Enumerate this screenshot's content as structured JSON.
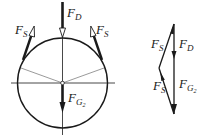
{
  "diagram": {
    "colors": {
      "ink": "#1a1a1a",
      "thin": "#555555",
      "background": "#ffffff"
    },
    "free_body": {
      "circle": {
        "cx": 62.5,
        "cy": 83,
        "r": 45
      },
      "forces": [
        {
          "id": "F_D",
          "label_main": "F",
          "label_sub": "D",
          "direction": "down",
          "arrowhead": "hollow"
        },
        {
          "id": "F_S_left",
          "label_main": "F",
          "label_sub": "S",
          "direction": "up-right tangent",
          "arrowhead": "hollow"
        },
        {
          "id": "F_S_right",
          "label_main": "F",
          "label_sub": "S",
          "direction": "up-left tangent",
          "arrowhead": "hollow"
        },
        {
          "id": "F_G2",
          "label_main": "F",
          "label_sub": "G",
          "label_subsub": "2",
          "direction": "down",
          "arrowhead": "filled"
        }
      ]
    },
    "force_polygon": {
      "vertices": {
        "top": [
          174,
          24
        ],
        "left": [
          159,
          68
        ],
        "bottom": [
          174,
          114
        ]
      },
      "labels": [
        {
          "id": "F_S_upper",
          "label_main": "F",
          "label_sub": "S"
        },
        {
          "id": "F_D",
          "label_main": "F",
          "label_sub": "D"
        },
        {
          "id": "F_S_lower",
          "label_main": "F",
          "label_sub": "S"
        },
        {
          "id": "F_G2",
          "label_main": "F",
          "label_sub": "G",
          "label_subsub": "2"
        }
      ]
    }
  }
}
